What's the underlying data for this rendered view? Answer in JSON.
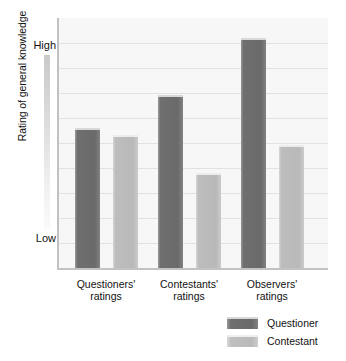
{
  "chart_data": {
    "type": "bar",
    "title": "",
    "xlabel": "",
    "ylabel": "Rating of general knowledge",
    "ylim": [
      0,
      100
    ],
    "y_tick_labels": [
      "High",
      "Low"
    ],
    "grid": true,
    "legend_position": "bottom-right",
    "categories": [
      "Questioners'\nratings",
      "Contestants'\nratings",
      "Observers'\nratings"
    ],
    "categories_display": [
      {
        "line1": "Questioners'",
        "line2": "ratings"
      },
      {
        "line1": "Contestants'",
        "line2": "ratings"
      },
      {
        "line1": "Observers'",
        "line2": "ratings"
      }
    ],
    "series": [
      {
        "name": "Questioner",
        "color": "#6a6a6a",
        "values": [
          56,
          69,
          92
        ]
      },
      {
        "name": "Contestant",
        "color": "#bababa",
        "values": [
          53,
          38,
          49
        ]
      }
    ]
  },
  "axis": {
    "y_title": "Rating of general knowledge",
    "high_label": "High",
    "low_label": "Low"
  },
  "legend": {
    "items": [
      {
        "label": "Questioner",
        "color": "#6a6a6a"
      },
      {
        "label": "Contestant",
        "color": "#bababa"
      }
    ]
  },
  "colors": {
    "questioner": "#6a6a6a",
    "contestant": "#bababa",
    "plot_background": "#f7f7f7",
    "gridline": "#e2e2e2",
    "axis": "#c2c2c2"
  }
}
